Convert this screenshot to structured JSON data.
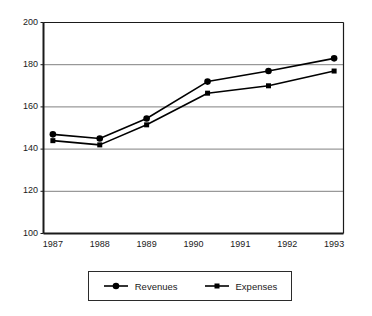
{
  "chart_data": {
    "type": "line",
    "title": "",
    "subtitle": "",
    "xlabel": "",
    "ylabel": "",
    "x": [
      1987,
      1988,
      1989,
      1990,
      1991,
      1992,
      1993
    ],
    "categories": [
      "1987",
      "1988",
      "1989",
      "1990",
      "1991",
      "1992",
      "1993"
    ],
    "xlim": [
      1986.8,
      1993.2
    ],
    "ylim": [
      100,
      200
    ],
    "yticks": [
      100,
      120,
      140,
      160,
      180,
      200
    ],
    "ytick_labels": [
      "100",
      "120",
      "140",
      "160",
      "180",
      "200"
    ],
    "xtick_labels": [
      "1987",
      "1988",
      "1989",
      "1990",
      "1991",
      "1992",
      "1993"
    ],
    "grid": "horizontal",
    "grid_color": "#808080",
    "axis_color": "#1a1a1a",
    "legend_position": "below-center",
    "series": [
      {
        "name": "Revenues",
        "marker": "circle",
        "color": "#000000",
        "x": [
          1987.0,
          1988.0,
          1989.0,
          1990.3,
          1991.6,
          1993.0
        ],
        "values": [
          147,
          145,
          154.5,
          172,
          177,
          183
        ]
      },
      {
        "name": "Expenses",
        "marker": "square",
        "color": "#000000",
        "x": [
          1987.0,
          1988.0,
          1989.0,
          1990.3,
          1991.6,
          1993.0
        ],
        "values": [
          144,
          142,
          151.5,
          166.5,
          170,
          177
        ]
      }
    ]
  },
  "legend": {
    "entries": [
      {
        "label": "Revenues",
        "marker": "circle"
      },
      {
        "label": "Expenses",
        "marker": "square"
      }
    ]
  }
}
